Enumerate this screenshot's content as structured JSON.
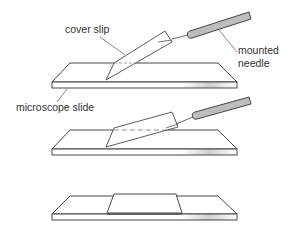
{
  "diagram": {
    "labels": {
      "cover_slip": "cover slip",
      "mounted_needle_line1": "mounted",
      "mounted_needle_line2": "needle",
      "microscope_slide": "microscope slide"
    },
    "steps": [
      {
        "step": 1,
        "description": "cover slip held at an angle with mounted needle, touching slide"
      },
      {
        "step": 2,
        "description": "cover slip being lowered onto slide with mounted needle"
      },
      {
        "step": 3,
        "description": "cover slip lying flat on slide"
      }
    ],
    "colors": {
      "line": "#333333",
      "needle_handle": "#bdbdbd",
      "slide_fill": "#ffffff",
      "slide_edge_gradient": "#d8d8d8"
    }
  }
}
